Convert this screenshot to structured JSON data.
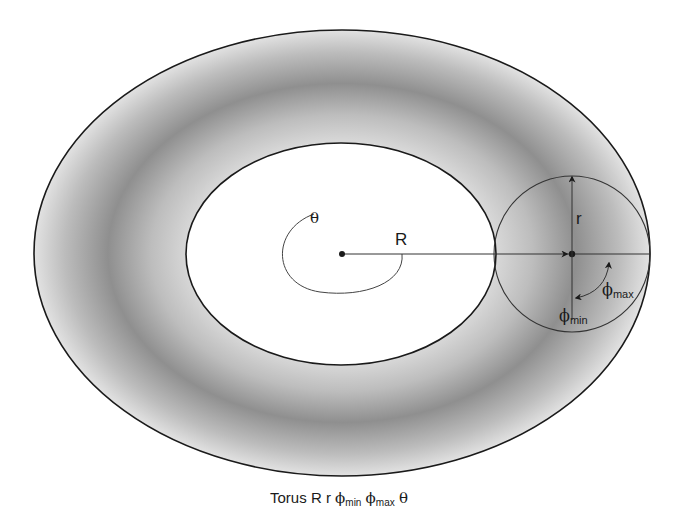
{
  "diagram": {
    "title": "Torus",
    "labels": {
      "theta": "θ",
      "R": "R",
      "r": "r",
      "phi": "ϕ",
      "phi_max_sub": "max",
      "phi_min_sub": "min"
    },
    "caption": {
      "word": "Torus",
      "R": "R",
      "r": "r",
      "phi": "ϕ",
      "min": "min",
      "max": "max",
      "theta": "θ"
    },
    "colors": {
      "stroke": "#1a1a1a",
      "ring_light": "#d6d6d6",
      "ring_dark": "#8e8e8e",
      "hole": "#ffffff"
    },
    "geometry": {
      "outer_ellipse": {
        "cx": 342,
        "cy": 253,
        "rx": 308,
        "ry": 223
      },
      "inner_ellipse": {
        "cx": 341,
        "cy": 254,
        "rx": 155,
        "ry": 111
      },
      "tube_circle": {
        "cx": 572,
        "cy": 254,
        "r": 78
      },
      "center_point": {
        "x": 342,
        "y": 254
      }
    }
  }
}
